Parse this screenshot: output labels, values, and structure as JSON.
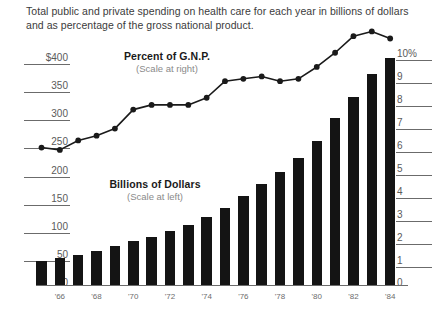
{
  "caption": "Total public and private spending on health care for each year in billions of dollars and as percentage of the gross national product.",
  "annotations": {
    "line_series": {
      "title": "Percent of G.N.P.",
      "scale_note": "(Scale at right)"
    },
    "bar_series": {
      "title": "Billions of Dollars",
      "scale_note": "(Scale at left)"
    }
  },
  "axes": {
    "left_ticks": [
      "$400",
      "350",
      "300",
      "250",
      "200",
      "150",
      "100",
      "50",
      "0"
    ],
    "right_ticks": [
      "10%",
      "9",
      "8",
      "7",
      "6",
      "5",
      "4",
      "3",
      "2",
      "1",
      "0"
    ],
    "x_ticks": [
      "'66",
      "'68",
      "'70",
      "'72",
      "'74",
      "'76",
      "'78",
      "'80",
      "'82",
      "'84"
    ]
  },
  "colors": {
    "bar": "#141414",
    "line": "#1a1a1a",
    "axis": "#6b6b6b",
    "tick_text": "#5a5a5a",
    "caption_text": "#3b3b3b",
    "background": "#ffffff"
  },
  "chart_data": {
    "type": "bar",
    "title": "",
    "subtitle": "Total public and private spending on health care for each year in billions of dollars and as percentage of the gross national product.",
    "xlabel": "",
    "ylabel": "Billions of Dollars",
    "y2label": "Percent of G.N.P.",
    "grid": false,
    "legend": "inline-annotations",
    "categories": [
      "'65",
      "'66",
      "'67",
      "'68",
      "'69",
      "'70",
      "'71",
      "'72",
      "'73",
      "'74",
      "'75",
      "'76",
      "'77",
      "'78",
      "'79",
      "'80",
      "'81",
      "'82",
      "'83",
      "'84"
    ],
    "x_tick_labels": [
      "'66",
      "'68",
      "'70",
      "'72",
      "'74",
      "'76",
      "'78",
      "'80",
      "'82",
      "'84"
    ],
    "ylim": [
      0,
      400
    ],
    "y2lim": [
      0,
      11
    ],
    "series": [
      {
        "name": "Billions of Dollars",
        "type": "bar",
        "axis": "left",
        "units": "billions of dollars",
        "values": [
          42,
          46,
          52,
          59,
          67,
          75,
          83,
          93,
          103,
          117,
          133,
          152,
          173,
          194,
          218,
          248,
          287,
          322,
          362,
          390
        ]
      },
      {
        "name": "Percent of G.N.P.",
        "type": "line",
        "axis": "right",
        "units": "percent",
        "values": [
          5.8,
          5.7,
          6.1,
          6.3,
          6.6,
          7.4,
          7.6,
          7.6,
          7.6,
          7.9,
          8.6,
          8.7,
          8.8,
          8.6,
          8.7,
          9.2,
          9.8,
          10.5,
          10.7,
          10.4
        ]
      }
    ]
  }
}
